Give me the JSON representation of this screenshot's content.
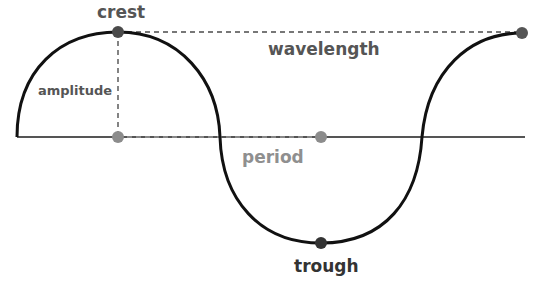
{
  "labels": {
    "crest": "crest",
    "trough": "trough",
    "amplitude": "amplitude",
    "wavelength": "wavelength",
    "period": "period"
  },
  "colors": {
    "wave": "#111111",
    "baseline": "#555555",
    "dashed": "#777777",
    "dark_dot": "#4a4a4a",
    "light_dot": "#8c8c8c",
    "dark_label": "#555555",
    "light_label": "#8f8f8f",
    "trough_label": "#333333"
  },
  "points": {
    "crest": [
      118,
      32
    ],
    "wavelength_end": [
      522,
      33
    ],
    "period_mark": [
      321,
      137
    ],
    "amplitude_base": [
      118,
      137
    ],
    "trough": [
      321,
      243
    ]
  }
}
